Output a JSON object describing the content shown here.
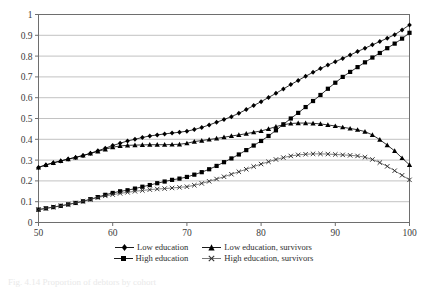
{
  "chart_data": {
    "type": "line",
    "title": "",
    "xlabel": "",
    "ylabel": "",
    "xlim": [
      50,
      100
    ],
    "ylim": [
      0,
      1
    ],
    "grid": true,
    "grid_axis": "y",
    "legend_position": "bottom",
    "xticks": [
      50,
      60,
      70,
      80,
      90,
      100
    ],
    "yticks": [
      0,
      0.1,
      0.2,
      0.3,
      0.4,
      0.5,
      0.6,
      0.7,
      0.8,
      0.9,
      1
    ],
    "xtick_labels": [
      "50",
      "60",
      "70",
      "80",
      "90",
      "100"
    ],
    "ytick_labels": [
      "0",
      "0.1",
      "0.2",
      "0.3",
      "0.4",
      "0.5",
      "0.6",
      "0.7",
      "0.8",
      "0.9",
      "1"
    ],
    "x": [
      50,
      51,
      52,
      53,
      54,
      55,
      56,
      57,
      58,
      59,
      60,
      61,
      62,
      63,
      64,
      65,
      66,
      67,
      68,
      69,
      70,
      71,
      72,
      73,
      74,
      75,
      76,
      77,
      78,
      79,
      80,
      81,
      82,
      83,
      84,
      85,
      86,
      87,
      88,
      89,
      90,
      91,
      92,
      93,
      94,
      95,
      96,
      97,
      98,
      99,
      100
    ],
    "series": [
      {
        "name": "Low education",
        "marker": "diamond",
        "color": "#000000",
        "values": [
          0.265,
          0.277,
          0.287,
          0.296,
          0.305,
          0.313,
          0.322,
          0.333,
          0.345,
          0.357,
          0.37,
          0.381,
          0.392,
          0.4,
          0.409,
          0.416,
          0.421,
          0.426,
          0.43,
          0.434,
          0.439,
          0.447,
          0.457,
          0.469,
          0.482,
          0.495,
          0.509,
          0.525,
          0.543,
          0.562,
          0.581,
          0.601,
          0.621,
          0.642,
          0.663,
          0.683,
          0.703,
          0.722,
          0.74,
          0.757,
          0.773,
          0.789,
          0.805,
          0.822,
          0.838,
          0.854,
          0.87,
          0.886,
          0.903,
          0.926,
          0.95
        ]
      },
      {
        "name": "Low education, survivors",
        "marker": "triangle",
        "color": "#000000",
        "values": [
          0.265,
          0.277,
          0.287,
          0.296,
          0.305,
          0.313,
          0.322,
          0.332,
          0.342,
          0.352,
          0.362,
          0.368,
          0.371,
          0.372,
          0.373,
          0.374,
          0.374,
          0.374,
          0.375,
          0.376,
          0.381,
          0.389,
          0.394,
          0.399,
          0.404,
          0.41,
          0.416,
          0.421,
          0.427,
          0.434,
          0.44,
          0.45,
          0.461,
          0.47,
          0.476,
          0.478,
          0.478,
          0.477,
          0.474,
          0.469,
          0.464,
          0.458,
          0.452,
          0.446,
          0.437,
          0.421,
          0.398,
          0.372,
          0.344,
          0.31,
          0.277
        ]
      },
      {
        "name": "High education",
        "marker": "square",
        "color": "#000000",
        "values": [
          0.062,
          0.068,
          0.074,
          0.08,
          0.087,
          0.094,
          0.102,
          0.112,
          0.122,
          0.133,
          0.142,
          0.15,
          0.155,
          0.163,
          0.172,
          0.18,
          0.189,
          0.197,
          0.205,
          0.211,
          0.219,
          0.23,
          0.242,
          0.256,
          0.272,
          0.29,
          0.308,
          0.327,
          0.348,
          0.37,
          0.392,
          0.416,
          0.443,
          0.472,
          0.5,
          0.527,
          0.555,
          0.584,
          0.613,
          0.643,
          0.672,
          0.7,
          0.724,
          0.747,
          0.77,
          0.793,
          0.815,
          0.838,
          0.86,
          0.884,
          0.912
        ]
      },
      {
        "name": "High education, survivors",
        "marker": "cross",
        "color": "#4a4a4a",
        "values": [
          0.062,
          0.068,
          0.074,
          0.08,
          0.087,
          0.094,
          0.102,
          0.111,
          0.12,
          0.128,
          0.134,
          0.14,
          0.145,
          0.15,
          0.154,
          0.158,
          0.161,
          0.163,
          0.166,
          0.169,
          0.172,
          0.179,
          0.188,
          0.198,
          0.209,
          0.22,
          0.232,
          0.244,
          0.256,
          0.269,
          0.281,
          0.292,
          0.303,
          0.312,
          0.32,
          0.325,
          0.328,
          0.33,
          0.33,
          0.329,
          0.327,
          0.325,
          0.323,
          0.32,
          0.314,
          0.303,
          0.288,
          0.27,
          0.249,
          0.227,
          0.205
        ]
      }
    ]
  },
  "legend": {
    "rows": [
      [
        {
          "label": "Low education",
          "marker": "diamond"
        },
        {
          "label": "Low education, survivors",
          "marker": "triangle"
        }
      ],
      [
        {
          "label": "High education",
          "marker": "square"
        },
        {
          "label": "High education, survivors",
          "marker": "cross"
        }
      ]
    ]
  },
  "caption": {
    "text": "Fig. 4.14   Proportion of debtors by cohort"
  }
}
